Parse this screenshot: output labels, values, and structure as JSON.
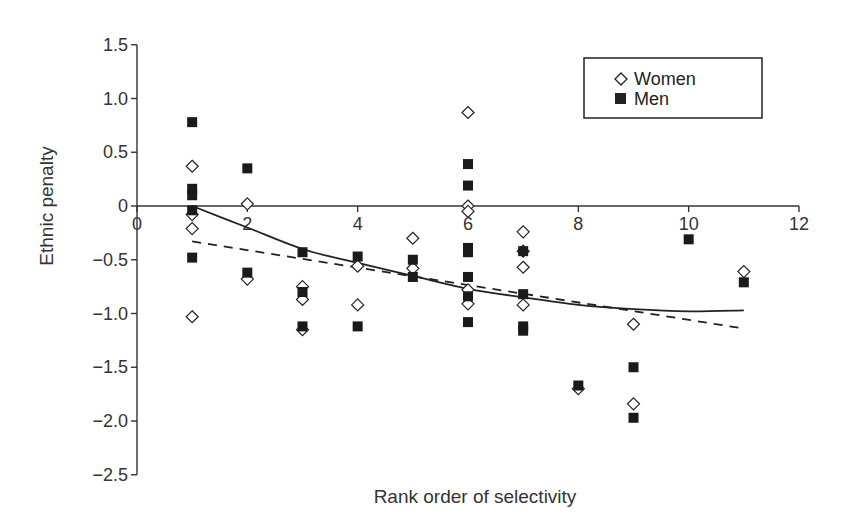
{
  "chart_data": {
    "type": "scatter",
    "title": "",
    "xlabel": "Rank order of selectivity",
    "ylabel": "Ethnic penalty",
    "xlim": [
      0,
      12
    ],
    "ylim": [
      -2.5,
      1.5
    ],
    "xticks": [
      0,
      2,
      4,
      6,
      8,
      10,
      12
    ],
    "yticks": [
      1.5,
      1.0,
      0.5,
      0,
      -0.5,
      -1.0,
      -1.5,
      -2.0,
      -2.5
    ],
    "xtick_labels": [
      "0",
      "2",
      "4",
      "6",
      "8",
      "10",
      "12"
    ],
    "ytick_labels": [
      "1.5",
      "1.0",
      "0.5",
      "0",
      "−0.5",
      "−1.0",
      "−1.5",
      "−2.0",
      "−2.5"
    ],
    "grid": false,
    "legend_position": "upper right",
    "series": [
      {
        "name": "Women",
        "marker": "open-diamond",
        "points": [
          [
            1,
            0.37
          ],
          [
            1,
            -0.08
          ],
          [
            1,
            -0.21
          ],
          [
            1,
            -1.03
          ],
          [
            2,
            0.02
          ],
          [
            2,
            -0.68
          ],
          [
            3,
            -0.75
          ],
          [
            3,
            -0.87
          ],
          [
            3,
            -1.15
          ],
          [
            4,
            -0.56
          ],
          [
            4,
            -0.92
          ],
          [
            5,
            -0.3
          ],
          [
            5,
            -0.58
          ],
          [
            6,
            0.87
          ],
          [
            6,
            0.0
          ],
          [
            6,
            -0.05
          ],
          [
            6,
            -0.78
          ],
          [
            6,
            -0.91
          ],
          [
            7,
            -0.24
          ],
          [
            7,
            -0.42
          ],
          [
            7,
            -0.57
          ],
          [
            7,
            -0.92
          ],
          [
            8,
            -1.7
          ],
          [
            9,
            -1.1
          ],
          [
            9,
            -1.84
          ],
          [
            11,
            -0.61
          ]
        ]
      },
      {
        "name": "Men",
        "marker": "filled-square",
        "points": [
          [
            1,
            0.78
          ],
          [
            1,
            0.16
          ],
          [
            1,
            0.1
          ],
          [
            1,
            -0.04
          ],
          [
            1,
            -0.48
          ],
          [
            2,
            0.35
          ],
          [
            2,
            -0.62
          ],
          [
            3,
            -0.43
          ],
          [
            3,
            -0.8
          ],
          [
            3,
            -1.12
          ],
          [
            4,
            -0.47
          ],
          [
            4,
            -1.12
          ],
          [
            5,
            -0.5
          ],
          [
            5,
            -0.66
          ],
          [
            6,
            0.39
          ],
          [
            6,
            0.19
          ],
          [
            6,
            -0.39
          ],
          [
            6,
            -0.43
          ],
          [
            6,
            -0.66
          ],
          [
            6,
            -0.84
          ],
          [
            6,
            -1.08
          ],
          [
            7,
            -0.42
          ],
          [
            7,
            -0.82
          ],
          [
            7,
            -1.12
          ],
          [
            7,
            -1.16
          ],
          [
            8,
            -1.67
          ],
          [
            9,
            -1.5
          ],
          [
            9,
            -1.97
          ],
          [
            10,
            -0.31
          ],
          [
            11,
            -0.71
          ]
        ]
      }
    ],
    "fit_lines": [
      {
        "name": "quadratic fit",
        "style": "solid",
        "points": [
          [
            1,
            0.0
          ],
          [
            2,
            -0.2
          ],
          [
            3,
            -0.4
          ],
          [
            4,
            -0.53
          ],
          [
            5,
            -0.65
          ],
          [
            6,
            -0.77
          ],
          [
            7,
            -0.85
          ],
          [
            8,
            -0.92
          ],
          [
            9,
            -0.96
          ],
          [
            10,
            -0.98
          ],
          [
            11,
            -0.97
          ]
        ]
      },
      {
        "name": "linear fit",
        "style": "dashed",
        "points": [
          [
            1,
            -0.33
          ],
          [
            11,
            -1.14
          ]
        ]
      }
    ]
  },
  "legend": {
    "items": [
      {
        "label": "Women",
        "marker": "open-diamond"
      },
      {
        "label": "Men",
        "marker": "filled-square"
      }
    ]
  },
  "axes": {
    "x_title": "Rank order of selectivity",
    "y_title": "Ethnic penalty"
  }
}
